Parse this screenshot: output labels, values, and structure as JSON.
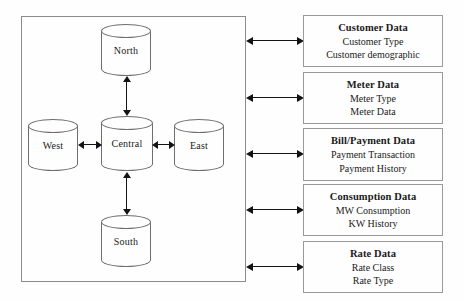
{
  "diagram": {
    "container": {
      "name": "regional-databases-container",
      "nodes": [
        {
          "id": "north",
          "label": "North",
          "shape": "cylinder"
        },
        {
          "id": "west",
          "label": "West",
          "shape": "cylinder"
        },
        {
          "id": "central",
          "label": "Central",
          "shape": "cylinder"
        },
        {
          "id": "east",
          "label": "East",
          "shape": "cylinder"
        },
        {
          "id": "south",
          "label": "South",
          "shape": "cylinder"
        }
      ],
      "edges": [
        {
          "from": "north",
          "to": "central",
          "type": "double-arrow",
          "orientation": "vertical"
        },
        {
          "from": "central",
          "to": "south",
          "type": "double-arrow",
          "orientation": "vertical"
        },
        {
          "from": "west",
          "to": "central",
          "type": "double-arrow",
          "orientation": "horizontal"
        },
        {
          "from": "central",
          "to": "east",
          "type": "double-arrow",
          "orientation": "horizontal"
        }
      ]
    },
    "entities": [
      {
        "title": "Customer Data",
        "lines": [
          "Customer Type",
          "Customer demographic"
        ]
      },
      {
        "title": "Meter Data",
        "lines": [
          "Meter Type",
          "Meter Data"
        ]
      },
      {
        "title": "Bill/Payment Data",
        "lines": [
          "Payment Transaction",
          "Payment History"
        ]
      },
      {
        "title": "Consumption Data",
        "lines": [
          "MW Consumption",
          "KW History"
        ]
      },
      {
        "title": "Rate Data",
        "lines": [
          "Rate Class",
          "Rate Type"
        ]
      }
    ],
    "colors": {
      "background": "#fefefe",
      "container_border": "#8c8c8c",
      "box_border": "#9a9a9a",
      "cylinder_stroke": "#6e6e6e",
      "arrow": "#131313",
      "text": "#1a1a1a"
    }
  }
}
